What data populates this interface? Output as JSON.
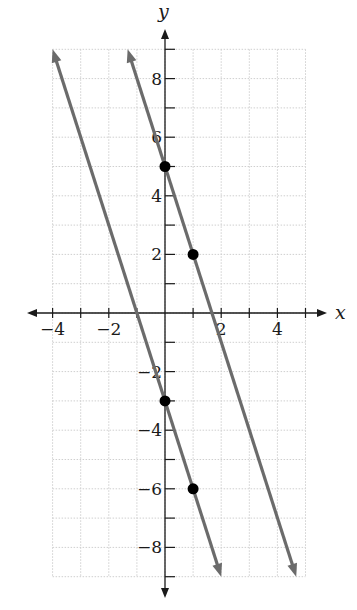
{
  "chart_data": {
    "type": "line",
    "title": "",
    "xlabel": "x",
    "ylabel": "y",
    "xlim": [
      -4,
      5
    ],
    "ylim": [
      -9,
      9
    ],
    "grid": true,
    "x_ticks": [
      -4,
      -3,
      -2,
      -1,
      0,
      1,
      2,
      3,
      4,
      5
    ],
    "x_tick_labels": [
      "−4",
      "−2",
      "2",
      "4"
    ],
    "x_tick_label_values": [
      -4,
      -2,
      2,
      4
    ],
    "y_ticks": [
      -9,
      -8,
      -7,
      -6,
      -5,
      -4,
      -3,
      -2,
      -1,
      0,
      1,
      2,
      3,
      4,
      5,
      6,
      7,
      8,
      9
    ],
    "y_tick_labels": [
      "8",
      "6",
      "4",
      "2",
      "−2",
      "−4",
      "−6",
      "−8"
    ],
    "y_tick_label_values": [
      8,
      6,
      4,
      2,
      -2,
      -4,
      -6,
      -8
    ],
    "series": [
      {
        "name": "line-upper",
        "equation": "y = -3x + 5",
        "slope": -3,
        "intercept": 5,
        "points": [
          {
            "x": 0,
            "y": 5
          },
          {
            "x": 1,
            "y": 2
          }
        ],
        "segment": {
          "x1": -1.33,
          "y1": 9,
          "x2": 4.67,
          "y2": -9
        }
      },
      {
        "name": "line-lower",
        "equation": "y = -3x - 3",
        "slope": -3,
        "intercept": -3,
        "points": [
          {
            "x": 0,
            "y": -3
          },
          {
            "x": 1,
            "y": -6
          }
        ],
        "segment": {
          "x1": -4,
          "y1": 9,
          "x2": 2,
          "y2": -9
        }
      }
    ],
    "colors": {
      "line": "#6b6b6b",
      "point": "#000000",
      "axis": "#1a1a1a",
      "grid": "#cfcfcf"
    }
  }
}
